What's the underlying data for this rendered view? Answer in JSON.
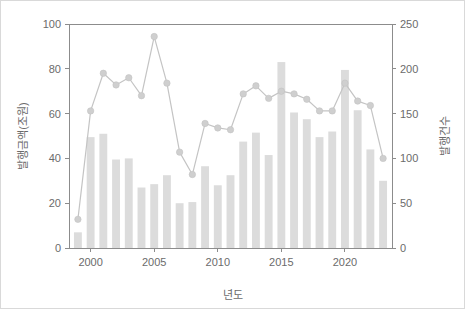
{
  "figure": {
    "background_color": "#ffffff",
    "border_color": "#d9d9d9",
    "bar_color": "#dcdcdc",
    "line_color": "#c4c4c4",
    "marker_color": "#cfcfcf",
    "axis_color": "#8c8c8c",
    "text_color": "#6b6b6b"
  },
  "chart_data": {
    "type": "bar",
    "title": "",
    "subtitle": "",
    "xlabel": "년도",
    "ylabel": "발행금액(조원)",
    "y2label": "발행건수",
    "grid": false,
    "legend": null,
    "legend_position": "none",
    "x": [
      1999,
      2000,
      2001,
      2002,
      2003,
      2004,
      2005,
      2006,
      2007,
      2008,
      2009,
      2010,
      2011,
      2012,
      2013,
      2014,
      2015,
      2016,
      2017,
      2018,
      2019,
      2020,
      2021,
      2022,
      2023
    ],
    "categories": [
      "1999",
      "2000",
      "2001",
      "2002",
      "2003",
      "2004",
      "2005",
      "2006",
      "2007",
      "2008",
      "2009",
      "2010",
      "2011",
      "2012",
      "2013",
      "2014",
      "2015",
      "2016",
      "2017",
      "2018",
      "2019",
      "2020",
      "2021",
      "2022",
      "2023"
    ],
    "xlim": [
      1998.3,
      2023.7
    ],
    "xticks": [
      2000,
      2005,
      2010,
      2015,
      2020
    ],
    "xticklabels": [
      "2000",
      "2005",
      "2010",
      "2015",
      "2020"
    ],
    "ylim": [
      0,
      100
    ],
    "yticks": [
      0,
      20,
      40,
      60,
      80,
      100
    ],
    "yticklabels": [
      "0",
      "20",
      "40",
      "60",
      "80",
      "100"
    ],
    "y2lim": [
      0,
      250
    ],
    "y2ticks": [
      0,
      50,
      100,
      150,
      200,
      250
    ],
    "y2ticklabels": [
      "0",
      "50",
      "100",
      "150",
      "200",
      "250"
    ],
    "series": [
      {
        "name": "발행금액(조원)",
        "type": "bar",
        "axis": "left",
        "values": [
          7,
          49.5,
          51,
          39.5,
          40,
          27,
          28.5,
          32.5,
          20,
          20.5,
          36.5,
          28,
          32.5,
          47.5,
          51.5,
          41.5,
          83,
          60.5,
          57.5,
          49.5,
          52,
          79.5,
          61.5,
          44,
          30
        ]
      },
      {
        "name": "발행건수",
        "type": "line",
        "axis": "right",
        "values": [
          32,
          153,
          195,
          182,
          190,
          170,
          236,
          184,
          107,
          82,
          139,
          134,
          132,
          172,
          181,
          167,
          175,
          172,
          166,
          153,
          153,
          184,
          164,
          159,
          100
        ]
      }
    ]
  }
}
